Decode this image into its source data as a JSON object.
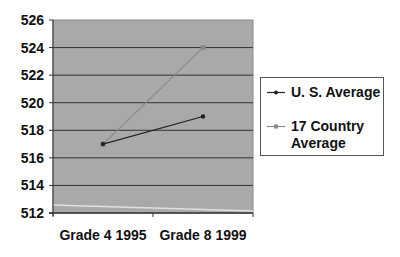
{
  "chart_data": {
    "type": "line",
    "title": "",
    "xlabel": "",
    "ylabel": "",
    "categories": [
      "Grade 4 1995",
      "Grade 8 1999"
    ],
    "series": [
      {
        "name": "U. S. Average",
        "values": [
          517,
          519
        ],
        "color": "#222222"
      },
      {
        "name": "17 Country Average",
        "values": [
          517,
          524
        ],
        "color": "#8a8a8a"
      }
    ],
    "ylim": [
      512,
      526
    ],
    "yticks": [
      526,
      524,
      522,
      520,
      518,
      516,
      514,
      512
    ],
    "grid": true,
    "plot_background": "#a9a9a9",
    "legend_position": "right"
  },
  "axis": {
    "y_labels": [
      "526",
      "524",
      "522",
      "520",
      "518",
      "516",
      "514",
      "512"
    ],
    "x_labels": [
      "Grade 4 1995",
      "Grade 8 1999"
    ]
  },
  "legend": {
    "items": [
      {
        "label": "U. S. Average"
      },
      {
        "label_line1": "17 Country",
        "label_line2": "Average"
      }
    ]
  }
}
